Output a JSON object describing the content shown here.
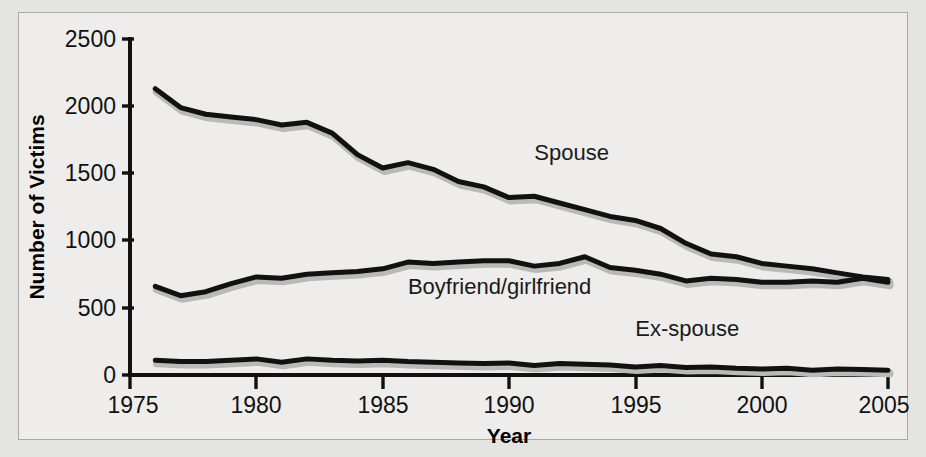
{
  "chart_data": {
    "type": "line",
    "title": "",
    "xlabel": "Year",
    "ylabel": "Number of Victims",
    "xlim": [
      1975,
      2005
    ],
    "ylim": [
      0,
      2500
    ],
    "xticks": [
      1975,
      1980,
      1985,
      1990,
      1995,
      2000,
      2005
    ],
    "yticks": [
      0,
      500,
      1000,
      1500,
      2000,
      2500
    ],
    "grid": false,
    "legend_position": "inline-annotations",
    "x": [
      1976,
      1977,
      1978,
      1979,
      1980,
      1981,
      1982,
      1983,
      1984,
      1985,
      1986,
      1987,
      1988,
      1989,
      1990,
      1991,
      1992,
      1993,
      1994,
      1995,
      1996,
      1997,
      1998,
      1999,
      2000,
      2001,
      2002,
      2003,
      2004,
      2005
    ],
    "series": [
      {
        "name": "Spouse",
        "color": "#111111",
        "label_x": 1991,
        "label_y": 1600,
        "values": [
          2130,
          1990,
          1940,
          1920,
          1900,
          1860,
          1880,
          1800,
          1640,
          1540,
          1580,
          1530,
          1440,
          1400,
          1320,
          1330,
          1280,
          1230,
          1180,
          1150,
          1090,
          980,
          900,
          880,
          830,
          810,
          790,
          760,
          730,
          710
        ]
      },
      {
        "name": "Boyfriend/girlfriend",
        "color": "#111111",
        "label_x": 1986,
        "label_y": 600,
        "values": [
          660,
          590,
          620,
          680,
          730,
          720,
          750,
          760,
          770,
          790,
          840,
          830,
          840,
          850,
          850,
          810,
          830,
          880,
          800,
          780,
          750,
          700,
          720,
          710,
          690,
          690,
          700,
          690,
          720,
          690
        ]
      },
      {
        "name": "Ex-spouse",
        "color": "#111111",
        "label_x": 1995,
        "label_y": 290,
        "values": [
          110,
          100,
          100,
          110,
          120,
          95,
          120,
          110,
          105,
          110,
          100,
          95,
          90,
          85,
          90,
          70,
          85,
          80,
          75,
          60,
          70,
          55,
          60,
          50,
          45,
          50,
          35,
          45,
          40,
          35
        ]
      }
    ]
  },
  "axes": {
    "ylabel": "Number of Victims",
    "xlabel": "Year",
    "ytick_labels": [
      "2500",
      "2000",
      "1500",
      "1000",
      "500",
      "0"
    ],
    "xtick_labels": [
      "1975",
      "1980",
      "1985",
      "1990",
      "1995",
      "2000",
      "2005"
    ]
  },
  "annotations": [
    {
      "text": "Spouse"
    },
    {
      "text": "Boyfriend/girlfriend"
    },
    {
      "text": "Ex-spouse"
    }
  ],
  "colors": {
    "background": "#eeedeb",
    "outer": "#e4e4e2",
    "frame": "#a9a9a7",
    "line": "#111111",
    "line_shadow": "#b9b9b7",
    "text": "#111111"
  }
}
